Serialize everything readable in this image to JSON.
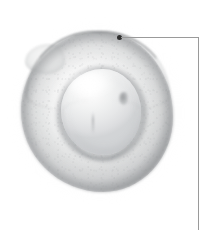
{
  "figure": {
    "type": "micrograph",
    "alt": "Light-microscopy image of a roughly circular cell with a brighter rounded inner body and a thin annotation leader line",
    "background_color": "#ffffff",
    "width": 215,
    "height": 230
  },
  "specimen": {
    "label": "cell-specimen",
    "shape": "irregular-round",
    "bounds": {
      "x": 21,
      "y": 32,
      "width": 152,
      "height": 160
    },
    "fill_color": "#eceded",
    "rim_color": "#76797c",
    "description": "Outer cell body with darker membrane rim, strongest along the upper contour"
  },
  "inner_body": {
    "label": "inner-body",
    "shape": "rounded-oval",
    "bounds": {
      "x": 61,
      "y": 69,
      "width": 80,
      "height": 86
    },
    "fill_color": "#e6e7e8",
    "highlight_color": "#ffffff",
    "description": "Brighter inner structure with specular highlight at upper left and a small dark notch at its right edge"
  },
  "annotation": {
    "label": "leader-line",
    "marker": {
      "label": "membrane-marker-point",
      "x": 119,
      "y": 37,
      "color": "#2f2f2f",
      "radius": 2.5
    },
    "line_color": "#9a9a9a",
    "segments": [
      {
        "orientation": "horizontal",
        "x1": 121,
        "y1": 37,
        "x2": 199,
        "y2": 37
      },
      {
        "orientation": "vertical",
        "x1": 198,
        "y1": 37,
        "x2": 198,
        "y2": 230
      }
    ]
  }
}
